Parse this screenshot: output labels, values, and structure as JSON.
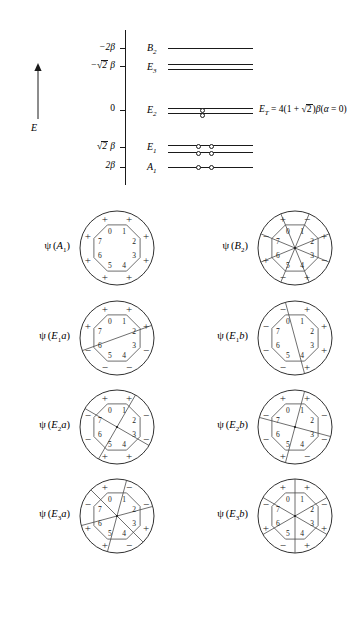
{
  "figure": {
    "type": "huckel-mo-diagram",
    "ring_size": 8,
    "vertex_labels": [
      "0",
      "1",
      "2",
      "3",
      "4",
      "5",
      "6",
      "7"
    ]
  },
  "energy_diagram": {
    "axis_label": "E",
    "axis_ticks": [
      {
        "label": "−2β",
        "value": -2,
        "y": 48
      },
      {
        "label": "−√2 β",
        "value": -1.414,
        "y": 66
      },
      {
        "label": "0",
        "value": 0,
        "y": 110
      },
      {
        "label": "√2 β",
        "value": 1.414,
        "y": 147
      },
      {
        "label": "2β",
        "value": 2,
        "y": 167
      }
    ],
    "levels": [
      {
        "name": "B2",
        "label_html": "B<sub>2</sub>",
        "energy": "-2β",
        "degeneracy": 1,
        "electrons": 0,
        "y": 48
      },
      {
        "name": "E3",
        "label_html": "E<sub>3</sub>",
        "energy": "-√2β",
        "degeneracy": 2,
        "electrons": 0,
        "y": 66
      },
      {
        "name": "E2",
        "label_html": "E<sub>2</sub>",
        "energy": "0",
        "degeneracy": 2,
        "electrons": 2,
        "y": 110
      },
      {
        "name": "E1",
        "label_html": "E<sub>1</sub>",
        "energy": "√2β",
        "degeneracy": 2,
        "electrons": 4,
        "y": 147
      },
      {
        "name": "A1",
        "label_html": "A<sub>1</sub>",
        "energy": "2β",
        "degeneracy": 1,
        "electrons": 2,
        "y": 167
      }
    ],
    "total_energy_text": "E_T = 4(1 + √2)β(α = 0)",
    "total_energy_parts": {
      "symbol": "E",
      "subscript": "T",
      "equals": " = 4(1 + ",
      "radical": "√",
      "radicand": "2",
      "tail": ")β(α = 0)"
    }
  },
  "orbitals": [
    {
      "id": "A1",
      "label_prefix": "ψ (",
      "label_symbol": "A",
      "label_sub": "1",
      "label_suffix": ")",
      "nodes": 0,
      "signs": [
        "+",
        "+",
        "+",
        "+",
        "+",
        "+",
        "+",
        "+"
      ],
      "node_angles": []
    },
    {
      "id": "B2",
      "label_prefix": "ψ (",
      "label_symbol": "B",
      "label_sub": "2",
      "label_suffix": ")",
      "nodes": 4,
      "signs": [
        "+",
        "−",
        "+",
        "−",
        "+",
        "−",
        "+",
        "−"
      ],
      "node_angles": [
        112.5,
        157.5,
        22.5,
        67.5
      ]
    },
    {
      "id": "E1a",
      "label_prefix": "ψ (",
      "label_symbol": "E",
      "label_sub": "1",
      "label_italic_tail": "a",
      "label_suffix": ")",
      "nodes": 1,
      "signs": [
        "+",
        "+",
        "+",
        "−",
        "−",
        "−",
        "−",
        "+"
      ],
      "node_angles": [
        20
      ]
    },
    {
      "id": "E1b",
      "label_prefix": "ψ (",
      "label_symbol": "E",
      "label_sub": "1",
      "label_italic_tail": "b",
      "label_suffix": ")",
      "nodes": 1,
      "signs": [
        "−",
        "+",
        "+",
        "+",
        "+",
        "−",
        "−",
        "−"
      ],
      "node_angles": [
        105
      ]
    },
    {
      "id": "E2a",
      "label_prefix": "ψ (",
      "label_symbol": "E",
      "label_sub": "2",
      "label_italic_tail": "a",
      "label_suffix": ")",
      "nodes": 2,
      "signs": [
        "+",
        "+",
        "−",
        "−",
        "+",
        "+",
        "−",
        "−"
      ],
      "node_angles": [
        60,
        150
      ]
    },
    {
      "id": "E2b",
      "label_prefix": "ψ (",
      "label_symbol": "E",
      "label_sub": "2",
      "label_italic_tail": "b",
      "label_suffix": ")",
      "nodes": 2,
      "signs": [
        "+",
        "+",
        "−",
        "−",
        "−",
        "+",
        "−",
        "−"
      ],
      "node_angles": [
        75,
        165
      ]
    },
    {
      "id": "E3a",
      "label_prefix": "ψ (",
      "label_symbol": "E",
      "label_sub": "3",
      "label_italic_tail": "a",
      "label_suffix": ")",
      "nodes": 3,
      "signs": [
        "+",
        "−",
        "−",
        "+",
        "−",
        "+",
        "+",
        "−"
      ],
      "node_angles": [
        15,
        75,
        135
      ]
    },
    {
      "id": "E3b",
      "label_prefix": "ψ (",
      "label_symbol": "E",
      "label_sub": "3",
      "label_italic_tail": "b",
      "label_suffix": ")",
      "nodes": 3,
      "signs": [
        "+",
        "+",
        "−",
        "+",
        "+",
        "−",
        "+",
        "−"
      ],
      "node_angles": [
        30,
        90,
        150
      ]
    }
  ]
}
